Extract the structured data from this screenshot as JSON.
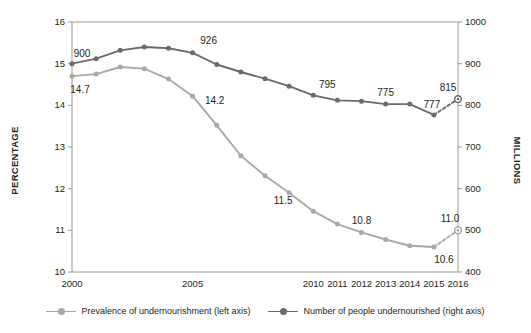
{
  "chart_data": {
    "type": "line",
    "title": "",
    "subtitle": "",
    "xlabel": "",
    "ylabel": "PERCENTAGE",
    "y2label": "MILLIONS",
    "grid": false,
    "legend_position": "bottom",
    "x": [
      2000,
      2001,
      2002,
      2003,
      2004,
      2005,
      2006,
      2007,
      2008,
      2009,
      2010,
      2011,
      2012,
      2013,
      2014,
      2015,
      2016
    ],
    "xtick_labels": [
      "2000",
      "",
      "",
      "",
      "",
      "2005",
      "",
      "",
      "",
      "",
      "2010",
      "2011",
      "2012",
      "2013",
      "2014",
      "2015",
      "2016"
    ],
    "xticks_shown": [
      "2000",
      "2005",
      "2010",
      "2011",
      "2012",
      "2013",
      "2014",
      "2015",
      "2016"
    ],
    "ylim": [
      10,
      16
    ],
    "yticks": [
      "10",
      "11",
      "12",
      "13",
      "14",
      "15",
      "16"
    ],
    "y2lim": [
      400,
      1000
    ],
    "y2ticks": [
      "400",
      "500",
      "600",
      "700",
      "800",
      "900",
      "1000"
    ],
    "series": [
      {
        "name": "Prevalence of undernourishment (left axis)",
        "axis": "left",
        "color": "#a8a8a8",
        "values": [
          14.7,
          14.75,
          14.92,
          14.88,
          14.63,
          14.22,
          13.52,
          12.79,
          12.31,
          11.9,
          11.46,
          11.15,
          10.95,
          10.78,
          10.63,
          10.6,
          11.0
        ],
        "labels": [
          {
            "x": 2000,
            "value": 14.7,
            "text": "14.7",
            "pos": "below"
          },
          {
            "x": 2005,
            "value": 14.22,
            "text": "14.2",
            "pos": "right"
          },
          {
            "x": 2009,
            "value": 11.9,
            "text": "11.5",
            "pos": "below"
          },
          {
            "x": 2012,
            "value": 10.95,
            "text": "10.8",
            "pos": "above"
          },
          {
            "x": 2015,
            "value": 10.6,
            "text": "10.6",
            "pos": "below"
          },
          {
            "x": 2016,
            "value": 11.0,
            "text": "11.0",
            "pos": "above"
          }
        ],
        "projected_point": {
          "x": 2016,
          "value": 11.0,
          "style": "dashed-open-marker"
        }
      },
      {
        "name": "Number of people undernourished (right axis)",
        "axis": "right",
        "color": "#6b6b6b",
        "values": [
          900,
          912,
          932,
          940,
          937,
          926,
          898,
          880,
          864,
          846,
          824,
          812,
          810,
          803,
          803,
          777,
          815
        ],
        "labels": [
          {
            "x": 2000,
            "value": 900,
            "text": "900",
            "pos": "above"
          },
          {
            "x": 2005,
            "value": 926,
            "text": "926",
            "pos": "above"
          },
          {
            "x": 2010,
            "value": 824,
            "text": "795",
            "pos": "above"
          },
          {
            "x": 2013,
            "value": 803,
            "text": "775",
            "pos": "above"
          },
          {
            "x": 2015,
            "value": 777,
            "text": "777",
            "pos": "above"
          },
          {
            "x": 2016,
            "value": 815,
            "text": "815",
            "pos": "above"
          }
        ],
        "projected_point": {
          "x": 2016,
          "value": 815,
          "style": "dashed-open-marker"
        }
      }
    ],
    "legend": [
      {
        "label": "Prevalence of undernourishment (left axis)",
        "color": "#a8a8a8"
      },
      {
        "label": "Number of people undernourished (right axis)",
        "color": "#6b6b6b"
      }
    ]
  },
  "colors": {
    "series_light": "#a8a8a8",
    "series_dark": "#6b6b6b",
    "axis": "#808080",
    "text": "#231f20",
    "background": "#ffffff"
  }
}
